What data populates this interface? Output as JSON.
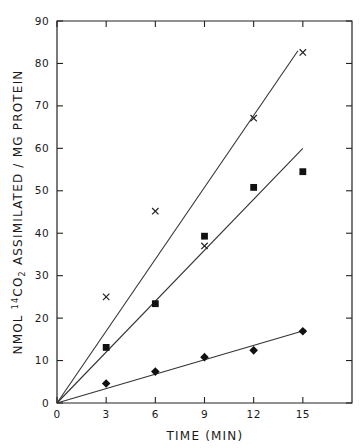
{
  "figure": {
    "background_color": "#ffffff",
    "ink_color": "#1a1a1a",
    "width": 364,
    "height": 448
  },
  "axes": {
    "x": {
      "title": "TIME (MIN)",
      "title_parts": {
        "word": "TIME",
        "unit": "(MIN)"
      },
      "ticks": [
        0,
        3,
        6,
        9,
        12,
        15
      ],
      "tick_labels": [
        "0",
        "3",
        "6",
        "9",
        "12",
        "15"
      ],
      "limits": [
        0,
        18
      ],
      "pixel": {
        "origin_x": 57,
        "right_x": 352
      }
    },
    "y": {
      "title": "NMOL 14CO2 ASSIMILATED / MG PROTEIN",
      "title_parts": {
        "prefix": "NMOL ",
        "isotope": "14",
        "element": "CO",
        "subscript": "2",
        "suffix": " ASSIMILATED / MG PROTEIN"
      },
      "ticks": [
        0,
        10,
        20,
        30,
        40,
        50,
        60,
        70,
        80,
        90
      ],
      "tick_labels": [
        "0",
        "10",
        "20",
        "30",
        "40",
        "50",
        "60",
        "70",
        "80",
        "90"
      ],
      "limits": [
        0,
        90
      ],
      "pixel": {
        "origin_y": 403,
        "top_y": 21
      }
    }
  },
  "chart_data": {
    "type": "scatter",
    "title": "",
    "xlabel": "TIME (MIN)",
    "ylabel": "NMOL 14CO2 ASSIMILATED / MG PROTEIN",
    "xlim": [
      0,
      18
    ],
    "ylim": [
      0,
      90
    ],
    "grid": false,
    "legend": "none",
    "x": [
      3,
      6,
      9,
      12,
      15
    ],
    "series": [
      {
        "name": "cross-series",
        "marker": "x",
        "values": [
          25.0,
          45.2,
          37.0,
          67.1,
          82.6
        ],
        "fit_line": {
          "x": [
            0,
            14.7
          ],
          "y": [
            0,
            83.0
          ],
          "through_origin": true
        }
      },
      {
        "name": "square-series",
        "marker": "square",
        "values": [
          13.1,
          23.4,
          39.3,
          50.8,
          54.5
        ],
        "fit_line": {
          "x": [
            0,
            15.0
          ],
          "y": [
            0,
            60.0
          ],
          "through_origin": true
        }
      },
      {
        "name": "diamond-series",
        "marker": "diamond",
        "values": [
          4.6,
          7.4,
          10.8,
          12.4,
          16.9
        ],
        "fit_line": {
          "x": [
            0,
            15.2
          ],
          "y": [
            0,
            17.2
          ],
          "through_origin": true
        }
      }
    ]
  }
}
